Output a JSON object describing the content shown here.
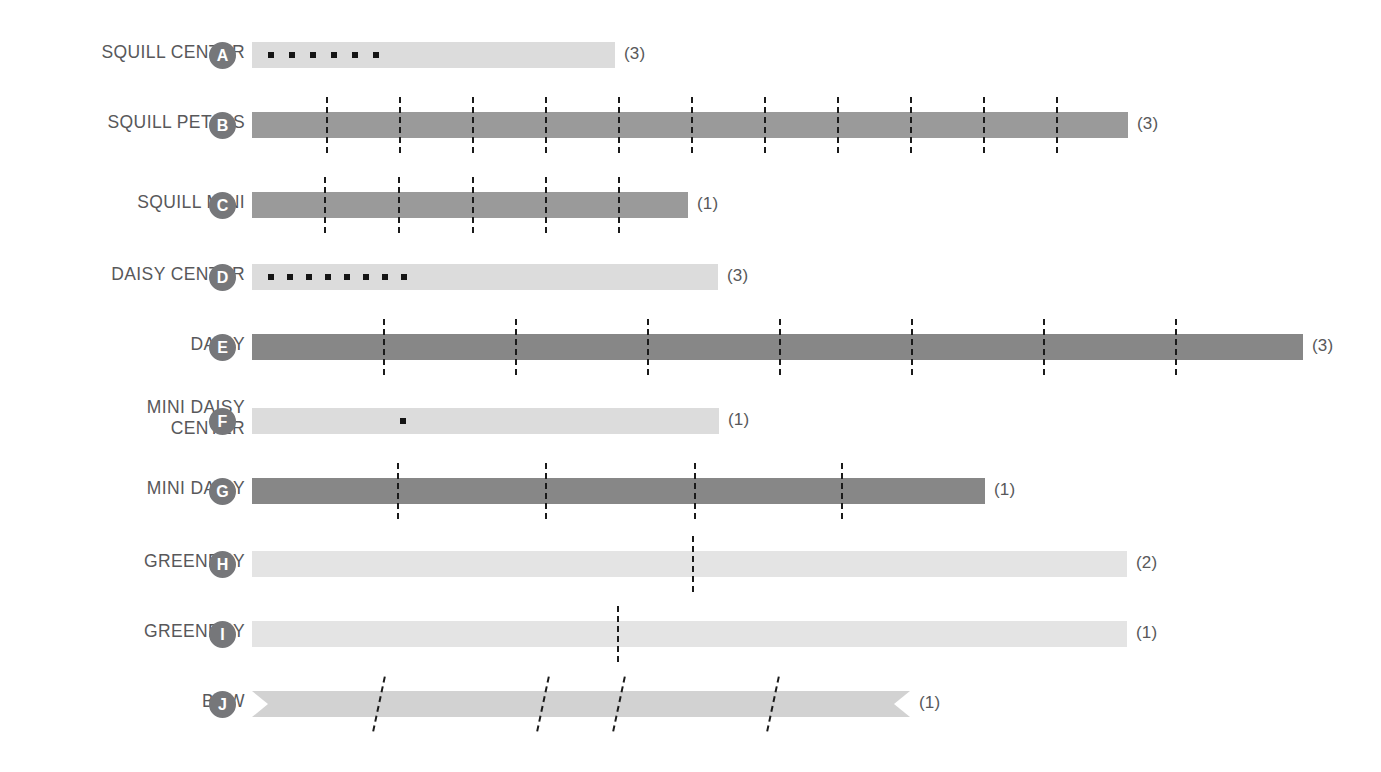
{
  "diagram": {
    "bar_start_x": 252,
    "row_height": 26,
    "colors": {
      "light": "#dcdcdc",
      "lighter": "#e6e6e6",
      "lightest": "#e4e4e4",
      "medium": "#a8a8a8",
      "dark": "#8a8a8a",
      "darker": "#7a7a7a",
      "badge": "#76777a",
      "text": "#58585a",
      "tick": "#1b1b1b"
    },
    "rows": [
      {
        "label": "SQUILL CENTER",
        "badge": "A",
        "count": "(3)",
        "bar_top": 42,
        "bar_end": 615,
        "shade": "#dcdcdc",
        "marker_type": "dots",
        "ticks": [],
        "dots": [
          268,
          289,
          310,
          331,
          352,
          373
        ],
        "ribbon": false
      },
      {
        "label": "SQUILL PETALS",
        "badge": "B",
        "count": "(3)",
        "bar_top": 112,
        "bar_end": 1128,
        "shade": "#9a9a9a",
        "marker_type": "ticks",
        "ticks": [
          326,
          399,
          472,
          545,
          618,
          691,
          764,
          837,
          910,
          983,
          1056
        ],
        "dots": [],
        "ribbon": false
      },
      {
        "label": "SQUILL MINI",
        "badge": "C",
        "count": "(1)",
        "bar_top": 192,
        "bar_end": 688,
        "shade": "#9a9a9a",
        "marker_type": "ticks",
        "ticks": [
          324,
          398,
          472,
          545,
          618
        ],
        "dots": [],
        "ribbon": false
      },
      {
        "label": "DAISY CENTER",
        "badge": "D",
        "count": "(3)",
        "bar_top": 264,
        "bar_end": 718,
        "shade": "#dcdcdc",
        "marker_type": "dots",
        "dots": [
          268,
          287,
          306,
          325,
          344,
          363,
          382,
          401
        ],
        "ticks": [],
        "ribbon": false
      },
      {
        "label": "DAISY",
        "badge": "E",
        "count": "(3)",
        "bar_top": 334,
        "bar_end": 1303,
        "shade": "#878787",
        "marker_type": "ticks",
        "ticks": [
          383,
          515,
          647,
          779,
          911,
          1043,
          1175
        ],
        "dots": [],
        "ribbon": false
      },
      {
        "label": "MINI DAISY\nCENTER",
        "badge": "F",
        "count": "(1)",
        "bar_top": 408,
        "bar_end": 719,
        "shade": "#dcdcdc",
        "marker_type": "dots",
        "dots": [
          400
        ],
        "ticks": [],
        "ribbon": false
      },
      {
        "label": "MINI DAISY",
        "badge": "G",
        "count": "(1)",
        "bar_top": 478,
        "bar_end": 985,
        "shade": "#878787",
        "marker_type": "ticks",
        "ticks": [
          397,
          545,
          694,
          841
        ],
        "dots": [],
        "ribbon": false
      },
      {
        "label": "GREENERY",
        "badge": "H",
        "count": "(2)",
        "bar_top": 551,
        "bar_end": 1127,
        "shade": "#e4e4e4",
        "marker_type": "ticks",
        "ticks": [
          692
        ],
        "dots": [],
        "ribbon": false
      },
      {
        "label": "GREENERY",
        "badge": "I",
        "count": "(1)",
        "bar_top": 621,
        "bar_end": 1127,
        "shade": "#e4e4e4",
        "marker_type": "ticks",
        "ticks": [
          617
        ],
        "dots": [],
        "ribbon": false
      },
      {
        "label": "BOW",
        "badge": "J",
        "count": "(1)",
        "bar_top": 691,
        "bar_end": 910,
        "shade": "#d2d2d2",
        "marker_type": "slanted",
        "ticks": [
          378,
          542,
          618,
          772
        ],
        "dots": [],
        "ribbon": true
      }
    ]
  }
}
